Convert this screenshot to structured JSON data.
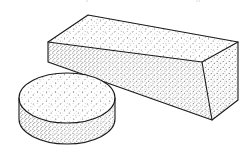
{
  "figure": {
    "background_color": "#ffffff",
    "ink_color": "#1a1a1a",
    "stipple_color": "#2b2b2b",
    "page_trim_text": {
      "fragment_left": "r",
      "fragment_center": "p",
      "fragment_right": "g",
      "legible": false
    },
    "objects": [
      {
        "id": "block",
        "name": "rectangular-block",
        "shape": "cuboid",
        "faces": [
          "top",
          "front",
          "right"
        ],
        "shading": "stipple",
        "label": "Rectangular block"
      },
      {
        "id": "disc",
        "name": "cylindrical-disc",
        "shape": "cylinder",
        "faces": [
          "top",
          "side"
        ],
        "shading": "stipple",
        "label": "Cylindrical disc"
      }
    ]
  },
  "geometry": {
    "canvas": {
      "width": 248,
      "height": 163
    },
    "block": {
      "top_face": [
        [
          88,
          15
        ],
        [
          238,
          42
        ],
        [
          202,
          62
        ],
        [
          48,
          42
        ]
      ],
      "front_face": [
        [
          48,
          42
        ],
        [
          202,
          62
        ],
        [
          212,
          120
        ],
        [
          48,
          62
        ]
      ],
      "right_face": [
        [
          202,
          62
        ],
        [
          238,
          42
        ],
        [
          238,
          100
        ],
        [
          212,
          120
        ]
      ],
      "top_apex": [
        88,
        15
      ],
      "right_apex": [
        238,
        42
      ]
    },
    "disc": {
      "center": [
        67,
        98
      ],
      "radius_x": 48,
      "radius_y": 25,
      "height": 36
    }
  }
}
